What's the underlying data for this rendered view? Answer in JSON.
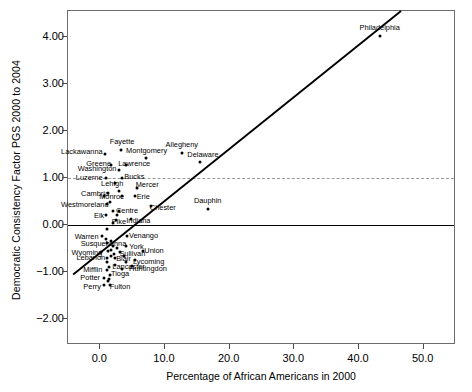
{
  "figure": {
    "x_axis_title": "Percentage of African Americans in 2000",
    "y_axis_title": "Democratic Consistency Factor PGS 2000 to 2004"
  },
  "chart_data": {
    "type": "scatter",
    "title": "",
    "xlabel": "Percentage of African Americans in 2000",
    "ylabel": "Democratic Consistency Factor PGS 2000 to 2004",
    "xlim": [
      -5.0,
      55.0
    ],
    "ylim": [
      -2.55,
      4.55
    ],
    "xticks": [
      "0.0",
      "10.0",
      "20.0",
      "30.0",
      "40.0",
      "50.0"
    ],
    "xtick_values": [
      0.0,
      10.0,
      20.0,
      30.0,
      40.0,
      50.0
    ],
    "yticks": [
      "-2.00",
      "-1.00",
      "0.00",
      "1.00",
      "2.00",
      "3.00",
      "4.00"
    ],
    "ytick_values": [
      -2.0,
      -1.0,
      0.0,
      1.0,
      2.0,
      3.0,
      4.0
    ],
    "grid": false,
    "legend": "none",
    "reference_lines": [
      {
        "name": "zero-line",
        "axis": "y",
        "value": 0.0,
        "style": "solid",
        "color": "#000000"
      },
      {
        "name": "unity-line",
        "axis": "y",
        "value": 1.0,
        "style": "dashed",
        "color": "#9a9a9a"
      }
    ],
    "fit_line": {
      "name": "regression-line",
      "style": "solid",
      "color": "#000000",
      "x_start": -4.2,
      "y_start": -1.05,
      "x_end": 46.5,
      "y_end": 4.55
    },
    "points": [
      {
        "label": "Philadelphia",
        "x": 43.2,
        "y": 4.02,
        "label_dx": 0,
        "label_dy": -8
      },
      {
        "label": "Allegheny",
        "x": 12.6,
        "y": 1.53,
        "label_dx": 0,
        "label_dy": -8
      },
      {
        "label": "Delaware",
        "x": 15.4,
        "y": 1.34,
        "label_dx": 3,
        "label_dy": -7
      },
      {
        "label": "Fayette",
        "x": 3.2,
        "y": 1.59,
        "label_dx": 1,
        "label_dy": -8
      },
      {
        "label": "Lackawanna",
        "x": 0.7,
        "y": 1.52,
        "label_dx": -23,
        "label_dy": -2
      },
      {
        "label": "Montgomery",
        "x": 7.0,
        "y": 1.42,
        "label_dx": 1,
        "label_dy": -7
      },
      {
        "label": "Greene",
        "x": 1.6,
        "y": 1.27,
        "label_dx": -12,
        "label_dy": -1
      },
      {
        "label": "Lawrence",
        "x": 4.0,
        "y": 1.28,
        "label_dx": 8,
        "label_dy": -1
      },
      {
        "label": "Washington",
        "x": 2.9,
        "y": 1.16,
        "label_dx": -22,
        "label_dy": -1
      },
      {
        "label": "Luzerne",
        "x": 0.9,
        "y": 1.0,
        "label_dx": -17,
        "label_dy": 0
      },
      {
        "label": "Bucks",
        "x": 3.4,
        "y": 1.0,
        "label_dx": 12,
        "label_dy": -1
      },
      {
        "label": "Lehigh",
        "x": 2.3,
        "y": 0.89,
        "label_dx": -3,
        "label_dy": 1
      },
      {
        "label": "Mercer",
        "x": 5.7,
        "y": 0.79,
        "label_dx": 10,
        "label_dy": -3
      },
      {
        "label": "Cambria",
        "x": 1.2,
        "y": 0.69,
        "label_dx": -13,
        "label_dy": 1
      },
      {
        "label": "Monroe",
        "x": 3.3,
        "y": 0.62,
        "label_dx": -10,
        "label_dy": 1
      },
      {
        "label": "Erie",
        "x": 5.4,
        "y": 0.62,
        "label_dx": 8,
        "label_dy": 1
      },
      {
        "label": "Westmoreland",
        "x": 1.0,
        "y": 0.45,
        "label_dx": -22,
        "label_dy": 1
      },
      {
        "label": "Chester",
        "x": 7.8,
        "y": 0.41,
        "label_dx": 12,
        "label_dy": 2
      },
      {
        "label": "Dauphin",
        "x": 16.6,
        "y": 0.34,
        "label_dx": 0,
        "label_dy": -8
      },
      {
        "label": "Centre",
        "x": 2.9,
        "y": 0.3,
        "label_dx": 8,
        "label_dy": 0
      },
      {
        "label": "Elk",
        "x": 0.9,
        "y": 0.22,
        "label_dx": -7,
        "label_dy": 1
      },
      {
        "label": "Pike",
        "x": 2.4,
        "y": 0.11,
        "label_dx": 3,
        "label_dy": 2
      },
      {
        "label": "Indiana",
        "x": 4.8,
        "y": 0.12,
        "label_dx": 7,
        "label_dy": 2
      },
      {
        "label": "Venango",
        "x": 4.2,
        "y": -0.23,
        "label_dx": 16,
        "label_dy": 0
      },
      {
        "label": "Warren",
        "x": 0.2,
        "y": -0.23,
        "label_dx": -15,
        "label_dy": 1
      },
      {
        "label": "Susquehanna",
        "x": 1.1,
        "y": -0.38,
        "label_dx": -4,
        "label_dy": 1
      },
      {
        "label": "York",
        "x": 3.9,
        "y": -0.44,
        "label_dx": 11,
        "label_dy": 1
      },
      {
        "label": "Wyoming",
        "x": 0.1,
        "y": -0.58,
        "label_dx": -14,
        "label_dy": 1
      },
      {
        "label": "Sullivan",
        "x": 3.1,
        "y": -0.57,
        "label_dx": 12,
        "label_dy": 2
      },
      {
        "label": "Union",
        "x": 6.6,
        "y": -0.56,
        "label_dx": 11,
        "label_dy": 0
      },
      {
        "label": "Lebanon",
        "x": 1.0,
        "y": -0.71,
        "label_dx": -16,
        "label_dy": 0
      },
      {
        "label": "Blair",
        "x": 2.2,
        "y": -0.71,
        "label_dx": 9,
        "label_dy": 1
      },
      {
        "label": "Lycoming",
        "x": 5.3,
        "y": -0.74,
        "label_dx": 14,
        "label_dy": 2
      },
      {
        "label": "Lancaster",
        "x": 2.2,
        "y": -0.86,
        "label_dx": 14,
        "label_dy": 2
      },
      {
        "label": "Huntingdon",
        "x": 4.9,
        "y": -0.87,
        "label_dx": 16,
        "label_dy": 3
      },
      {
        "label": "Mifflin",
        "x": 1.0,
        "y": -0.95,
        "label_dx": -14,
        "label_dy": 0
      },
      {
        "label": "Tioga",
        "x": 1.5,
        "y": -1.07,
        "label_dx": 10,
        "label_dy": -1
      },
      {
        "label": "Potter",
        "x": 0.6,
        "y": -1.12,
        "label_dx": -14,
        "label_dy": 0
      },
      {
        "label": "Fulton",
        "x": 1.5,
        "y": -1.27,
        "label_dx": 10,
        "label_dy": 2
      },
      {
        "label": "Perry",
        "x": 0.6,
        "y": -1.28,
        "label_dx": -12,
        "label_dy": 2
      },
      {
        "label": "",
        "x": 2.6,
        "y": 0.22,
        "label_dx": 0,
        "label_dy": 0
      },
      {
        "label": "",
        "x": 2.0,
        "y": 0.3,
        "label_dx": 0,
        "label_dy": 0
      },
      {
        "label": "",
        "x": 1.5,
        "y": 0.5,
        "label_dx": 0,
        "label_dy": 0
      },
      {
        "label": "",
        "x": 2.0,
        "y": 0.05,
        "label_dx": 0,
        "label_dy": 0
      },
      {
        "label": "",
        "x": 1.1,
        "y": -0.08,
        "label_dx": 0,
        "label_dy": 0
      },
      {
        "label": "",
        "x": 0.8,
        "y": -0.3,
        "label_dx": 0,
        "label_dy": 0
      },
      {
        "label": "",
        "x": 1.6,
        "y": -0.33,
        "label_dx": 0,
        "label_dy": 0
      },
      {
        "label": "",
        "x": 2.0,
        "y": -0.45,
        "label_dx": 0,
        "label_dy": 0
      },
      {
        "label": "",
        "x": 2.6,
        "y": -0.48,
        "label_dx": 0,
        "label_dy": 0
      },
      {
        "label": "",
        "x": 1.6,
        "y": -0.52,
        "label_dx": 0,
        "label_dy": 0
      },
      {
        "label": "",
        "x": 1.2,
        "y": -0.56,
        "label_dx": 0,
        "label_dy": 0
      },
      {
        "label": "",
        "x": 2.1,
        "y": -0.62,
        "label_dx": 0,
        "label_dy": 0
      },
      {
        "label": "",
        "x": 1.6,
        "y": -0.66,
        "label_dx": 0,
        "label_dy": 0
      },
      {
        "label": "",
        "x": 3.6,
        "y": -0.66,
        "label_dx": 0,
        "label_dy": 0
      },
      {
        "label": "",
        "x": 1.0,
        "y": -0.78,
        "label_dx": 0,
        "label_dy": 0
      },
      {
        "label": "",
        "x": 4.0,
        "y": -0.79,
        "label_dx": 0,
        "label_dy": 0
      },
      {
        "label": "",
        "x": 1.4,
        "y": -0.9,
        "label_dx": 0,
        "label_dy": 0
      },
      {
        "label": "",
        "x": 3.4,
        "y": -0.93,
        "label_dx": 0,
        "label_dy": 0
      },
      {
        "label": "",
        "x": 1.3,
        "y": -1.14,
        "label_dx": 0,
        "label_dy": 0
      },
      {
        "label": "",
        "x": 1.2,
        "y": -1.2,
        "label_dx": 0,
        "label_dy": 0
      },
      {
        "label": "",
        "x": 0.5,
        "y": 0.62,
        "label_dx": 0,
        "label_dy": 0
      },
      {
        "label": "",
        "x": 2.9,
        "y": 0.72,
        "label_dx": 0,
        "label_dy": 0
      }
    ]
  }
}
